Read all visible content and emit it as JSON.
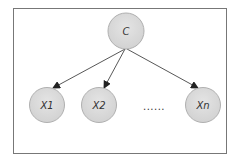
{
  "diagram": {
    "type": "bayesian-network",
    "root": {
      "id": "C",
      "label": "C"
    },
    "children": [
      {
        "id": "X1",
        "label": "X1"
      },
      {
        "id": "X2",
        "label": "X2"
      },
      {
        "id": "Xn",
        "label": "Xn"
      }
    ],
    "ellipsis": "......",
    "edges": [
      {
        "from": "C",
        "to": "X1"
      },
      {
        "from": "C",
        "to": "X2"
      },
      {
        "from": "C",
        "to": "Xn"
      }
    ],
    "colors": {
      "node_fill": "#dcdcdc",
      "node_stroke": "#b0b0b0",
      "edge": "#444444",
      "frame": "#777777"
    }
  }
}
